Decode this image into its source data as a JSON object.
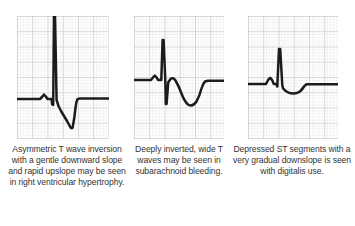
{
  "figure": {
    "background_color": "#ffffff",
    "trace_color": "#1c1c1c",
    "grid_minor_color": "#d9d9de",
    "grid_major_color": "#bdbdc6",
    "caption_color": "#343434"
  },
  "panels": [
    {
      "id": "panel-1",
      "label": "asymmetric-t-wave-inversion",
      "caption": "Asymmetric T wave inversion with a gentle downward slope and rapid upslope may be seen in right ventricular hypertrophy.",
      "caption_lines": [
        "Asymmetric T wave",
        "inversion with a gentle",
        "downward slope and",
        "rapid upslope may be",
        "seen in right ventricular",
        "hypertrophy."
      ],
      "grid": {
        "minor_cell_px": 3,
        "major_every": 5,
        "cols": 30,
        "rows": 41
      },
      "waveform": {
        "name": "asymmetric-inverted-t-wave",
        "baseline_y_frac": 0.675,
        "features": [
          "flat isoelectric baseline",
          "small upright P wave",
          "narrow Q dip",
          "very tall R spike clipped at top of strip",
          "deep S descent",
          "gentle downward-sloping inverted T wave",
          "rapid upslope back to baseline"
        ]
      }
    },
    {
      "id": "panel-2",
      "label": "deeply-inverted-wide-t-waves",
      "caption": "Deeply inverted, wide T waves may be seen in subarachnoid bleeding.",
      "caption_lines": [
        "Deeply inverted,",
        "wide T waves may",
        "be seen in",
        "subarachnoid",
        "bleeding."
      ],
      "grid": {
        "minor_cell_px": 3,
        "major_every": 5,
        "cols": 30,
        "rows": 41
      },
      "waveform": {
        "name": "deeply-inverted-wide-t-wave",
        "baseline_y_frac": 0.52,
        "features": [
          "flat isoelectric baseline",
          "small upright P wave",
          "tall narrow R spike",
          "deep narrow S descent below baseline",
          "broad rounded deeply inverted T wave",
          "smooth return to baseline"
        ]
      }
    },
    {
      "id": "panel-3",
      "label": "depressed-st-segment-digitalis",
      "caption": "Depressed ST segments with a very gradual downslope is seen with digitalis use.",
      "caption_lines": [
        "Depressed ST",
        "segments with a very",
        "gradual downslope is",
        "seen with digitalis use."
      ],
      "grid": {
        "minor_cell_px": 3,
        "major_every": 5,
        "cols": 30,
        "rows": 41
      },
      "waveform": {
        "name": "sagging-st-depression",
        "baseline_y_frac": 0.55,
        "features": [
          "flat isoelectric baseline",
          "small upright P wave",
          "moderate R spike",
          "gradual downsloping scooped ST depression",
          "shallow rounded trough",
          "return to baseline"
        ]
      }
    }
  ]
}
